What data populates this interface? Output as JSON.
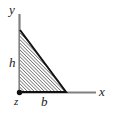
{
  "figure": {
    "type": "geometry-diagram",
    "background_color": "#ffffff",
    "axes": {
      "vertical": {
        "name": "y-axis",
        "label": "y",
        "color": "#808080",
        "x": 19.5,
        "y_top": 14,
        "y_bottom": 92
      },
      "horizontal": {
        "name": "x-axis",
        "label": "x",
        "color": "#808080",
        "y": 92.5,
        "x_left": 19.5,
        "x_right": 96
      }
    },
    "origin": {
      "label": "z",
      "marker": "filled-dot",
      "color": "#111111",
      "x": 19.5,
      "y": 92.5,
      "radius": 2.6
    },
    "shape": {
      "name": "hatched-right-triangle",
      "outline_color": "#111111",
      "outline_width": 2,
      "hatch_color": "#1a1a1a",
      "hatch_angle_deg": 45,
      "hatch_spacing_px": 2.4,
      "vertices": [
        {
          "name": "apex",
          "x": 20,
          "y": 30
        },
        {
          "name": "origin",
          "x": 20,
          "y": 92
        },
        {
          "name": "base-end",
          "x": 66,
          "y": 92
        }
      ]
    },
    "dimensions": [
      {
        "name": "height-label",
        "label": "h",
        "axis": "vertical",
        "value_symbol": "h"
      },
      {
        "name": "base-label",
        "label": "b",
        "axis": "horizontal",
        "value_symbol": "b"
      }
    ],
    "labels": {
      "y": "y",
      "x": "x",
      "h": "h",
      "b": "b",
      "z": "z"
    }
  }
}
